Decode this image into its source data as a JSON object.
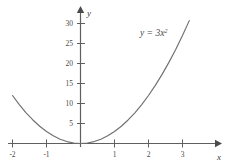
{
  "chart_data": {
    "type": "line",
    "title": "",
    "subtitle": "",
    "xlabel": "x",
    "ylabel": "y",
    "equation_label": "y = 3x",
    "equation_exponent": "2",
    "expression": "y = 3x^2",
    "xlim": [
      -2.1,
      3.6
    ],
    "ylim": [
      0,
      33
    ],
    "xticks": [
      -2,
      -1,
      1,
      2,
      3
    ],
    "xtick_labels": [
      "-2",
      "-1",
      "1",
      "2",
      "3"
    ],
    "yticks": [
      5,
      10,
      15,
      20,
      25,
      30
    ],
    "ytick_labels": [
      "5",
      "10",
      "15",
      "20",
      "25",
      "30"
    ],
    "grid": false,
    "legend": "none",
    "axes_style": "arrow-ended cartesian axes through origin",
    "x": [
      -2.0,
      -1.8,
      -1.6,
      -1.4,
      -1.2,
      -1.0,
      -0.8,
      -0.6,
      -0.4,
      -0.2,
      0.0,
      0.2,
      0.4,
      0.6,
      0.8,
      1.0,
      1.2,
      1.4,
      1.6,
      1.8,
      2.0,
      2.2,
      2.4,
      2.6,
      2.8,
      3.0,
      3.2
    ],
    "values": [
      12.0,
      9.72,
      7.68,
      5.88,
      4.32,
      3.0,
      1.92,
      1.08,
      0.48,
      0.12,
      0.0,
      0.12,
      0.48,
      1.08,
      1.92,
      3.0,
      4.32,
      5.88,
      7.68,
      9.72,
      12.0,
      14.52,
      17.28,
      20.28,
      23.52,
      27.0,
      30.72
    ],
    "series": [
      {
        "name": "y = 3x^2",
        "values": [
          12.0,
          9.72,
          7.68,
          5.88,
          4.32,
          3.0,
          1.92,
          1.08,
          0.48,
          0.12,
          0.0,
          0.12,
          0.48,
          1.08,
          1.92,
          3.0,
          4.32,
          5.88,
          7.68,
          9.72,
          12.0,
          14.52,
          17.28,
          20.28,
          23.52,
          27.0,
          30.72
        ]
      }
    ],
    "colors": {
      "curve": "#6f6f6f",
      "axis": "#5a5a5a",
      "text": "#4a4a4a",
      "background": "#ffffff"
    }
  }
}
